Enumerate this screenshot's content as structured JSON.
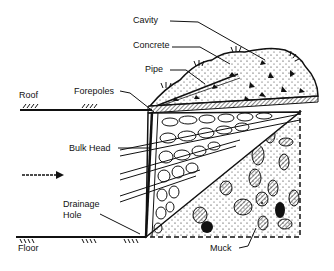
{
  "diagram": {
    "labels": {
      "cavity": "Cavity",
      "concrete": "Concrete",
      "pipe": "Pipe",
      "roof": "Roof",
      "forepoles": "Forepoles",
      "bulk_head": "Bulk Head",
      "drainage_hole_line1": "Drainage",
      "drainage_hole_line2": "Hole",
      "floor": "Floor",
      "muck": "Muck"
    },
    "icons": {
      "direction_arrow": "right-arrow"
    },
    "colors": {
      "ink": "#111111",
      "background": "#ffffff"
    }
  }
}
